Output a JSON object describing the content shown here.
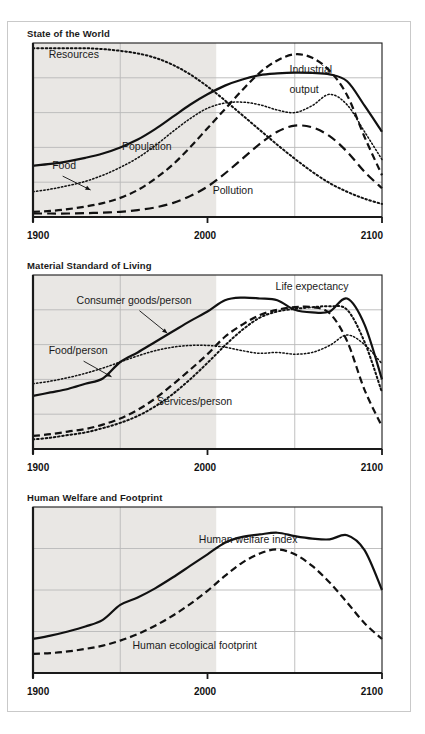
{
  "figure": {
    "panels": [
      {
        "title": "State of the World",
        "axis": {
          "start": "1900",
          "mid": "2000",
          "end": "2100"
        },
        "annotations": [
          {
            "name": "resources",
            "label": "Resources",
            "x": 0.045,
            "y": 0.085
          },
          {
            "name": "industrial-output-line1",
            "label": "Industrial",
            "x": 0.735,
            "y": 0.175
          },
          {
            "name": "industrial-output-line2",
            "label": "output",
            "x": 0.735,
            "y": 0.285
          },
          {
            "name": "population",
            "label": "Population",
            "x": 0.255,
            "y": 0.615
          },
          {
            "name": "food",
            "label": "Food",
            "x": 0.055,
            "y": 0.725
          },
          {
            "name": "pollution",
            "label": "Pollution",
            "x": 0.515,
            "y": 0.865
          }
        ]
      },
      {
        "title": "Material Standard of Living",
        "axis": {
          "start": "1900",
          "mid": "2000",
          "end": "2100"
        },
        "annotations": [
          {
            "name": "consumer-goods-per-person",
            "label": "Consumer goods/person",
            "x": 0.125,
            "y": 0.165
          },
          {
            "name": "life-expectancy",
            "label": "Life expectancy",
            "x": 0.695,
            "y": 0.085
          },
          {
            "name": "food-per-person",
            "label": "Food/person",
            "x": 0.045,
            "y": 0.455
          },
          {
            "name": "services-per-person",
            "label": "Services/person",
            "x": 0.355,
            "y": 0.745
          }
        ]
      },
      {
        "title": "Human Welfare and Footprint",
        "axis": {
          "start": "1900",
          "mid": "2000",
          "end": "2100"
        },
        "annotations": [
          {
            "name": "human-welfare-index",
            "label": "Human welfare index",
            "x": 0.475,
            "y": 0.215
          },
          {
            "name": "human-ecological-footprint",
            "label": "Human ecological footprint",
            "x": 0.285,
            "y": 0.855
          }
        ]
      }
    ]
  },
  "chart_data": [
    {
      "type": "line",
      "title": "State of the World",
      "xlabel": "",
      "ylabel": "",
      "xlim": [
        1900,
        2100
      ],
      "xticks": [
        1900,
        2000,
        2100
      ],
      "ytick_gridlines": 4,
      "grid": true,
      "shaded_history_end": 2005,
      "legend": "inline-annotations",
      "x": [
        1900,
        1910,
        1920,
        1930,
        1940,
        1950,
        1960,
        1970,
        1980,
        1990,
        2000,
        2010,
        2020,
        2030,
        2040,
        2050,
        2060,
        2070,
        2080,
        2090,
        2100
      ],
      "series": [
        {
          "name": "Resources",
          "style": "dotted",
          "values": [
            0.97,
            0.97,
            0.97,
            0.97,
            0.965,
            0.955,
            0.94,
            0.915,
            0.875,
            0.82,
            0.75,
            0.67,
            0.585,
            0.5,
            0.415,
            0.335,
            0.26,
            0.195,
            0.145,
            0.105,
            0.075
          ]
        },
        {
          "name": "Industrial output",
          "style": "dashed",
          "values": [
            0.03,
            0.035,
            0.045,
            0.06,
            0.08,
            0.11,
            0.155,
            0.22,
            0.3,
            0.4,
            0.51,
            0.62,
            0.73,
            0.83,
            0.9,
            0.935,
            0.915,
            0.84,
            0.7,
            0.46,
            0.24
          ]
        },
        {
          "name": "Population",
          "style": "solid",
          "values": [
            0.295,
            0.305,
            0.32,
            0.34,
            0.365,
            0.4,
            0.445,
            0.505,
            0.575,
            0.645,
            0.705,
            0.755,
            0.79,
            0.815,
            0.825,
            0.83,
            0.828,
            0.82,
            0.78,
            0.64,
            0.49
          ]
        },
        {
          "name": "Food",
          "style": "dotted-fine",
          "values": [
            0.145,
            0.16,
            0.18,
            0.205,
            0.24,
            0.285,
            0.34,
            0.41,
            0.49,
            0.565,
            0.625,
            0.655,
            0.66,
            0.645,
            0.615,
            0.6,
            0.64,
            0.705,
            0.645,
            0.49,
            0.33
          ]
        },
        {
          "name": "Pollution",
          "style": "dashed-long",
          "values": [
            0.02,
            0.02,
            0.02,
            0.022,
            0.025,
            0.03,
            0.04,
            0.055,
            0.08,
            0.12,
            0.175,
            0.25,
            0.335,
            0.42,
            0.49,
            0.525,
            0.515,
            0.465,
            0.375,
            0.26,
            0.165
          ]
        }
      ]
    },
    {
      "type": "line",
      "title": "Material Standard of Living",
      "xlabel": "",
      "ylabel": "",
      "xlim": [
        1900,
        2100
      ],
      "xticks": [
        1900,
        2000,
        2100
      ],
      "ytick_gridlines": 4,
      "grid": true,
      "shaded_history_end": 2005,
      "legend": "inline-annotations",
      "x": [
        1900,
        1910,
        1920,
        1930,
        1940,
        1950,
        1960,
        1970,
        1980,
        1990,
        2000,
        2010,
        2020,
        2030,
        2040,
        2050,
        2060,
        2070,
        2080,
        2090,
        2100
      ],
      "series": [
        {
          "name": "Life expectancy",
          "style": "solid",
          "values": [
            0.305,
            0.325,
            0.345,
            0.375,
            0.405,
            0.5,
            0.555,
            0.615,
            0.675,
            0.735,
            0.79,
            0.855,
            0.87,
            0.865,
            0.855,
            0.8,
            0.785,
            0.79,
            0.865,
            0.715,
            0.4
          ]
        },
        {
          "name": "Consumer goods/person",
          "style": "dashed",
          "values": [
            0.075,
            0.085,
            0.1,
            0.115,
            0.14,
            0.175,
            0.225,
            0.29,
            0.37,
            0.455,
            0.545,
            0.645,
            0.715,
            0.77,
            0.8,
            0.815,
            0.815,
            0.78,
            0.62,
            0.34,
            0.13
          ]
        },
        {
          "name": "Food/person",
          "style": "dotted",
          "values": [
            0.055,
            0.065,
            0.08,
            0.095,
            0.12,
            0.15,
            0.19,
            0.245,
            0.315,
            0.4,
            0.495,
            0.595,
            0.685,
            0.755,
            0.79,
            0.805,
            0.815,
            0.82,
            0.8,
            0.615,
            0.325
          ]
        },
        {
          "name": "Services/person",
          "style": "dotted-fine",
          "values": [
            0.375,
            0.39,
            0.41,
            0.435,
            0.465,
            0.5,
            0.535,
            0.565,
            0.585,
            0.595,
            0.595,
            0.585,
            0.565,
            0.55,
            0.555,
            0.545,
            0.555,
            0.595,
            0.655,
            0.6,
            0.49
          ]
        }
      ]
    },
    {
      "type": "line",
      "title": "Human Welfare and Footprint",
      "xlabel": "",
      "ylabel": "",
      "xlim": [
        1900,
        2100
      ],
      "xticks": [
        1900,
        2000,
        2100
      ],
      "ytick_gridlines": 3,
      "grid": true,
      "shaded_history_end": 2005,
      "legend": "inline-annotations",
      "x": [
        1900,
        1910,
        1920,
        1930,
        1940,
        1950,
        1960,
        1970,
        1980,
        1990,
        2000,
        2010,
        2020,
        2030,
        2040,
        2050,
        2060,
        2070,
        2080,
        2090,
        2100
      ],
      "series": [
        {
          "name": "Human welfare index",
          "style": "solid",
          "values": [
            0.205,
            0.225,
            0.25,
            0.28,
            0.32,
            0.41,
            0.455,
            0.51,
            0.575,
            0.645,
            0.715,
            0.785,
            0.82,
            0.835,
            0.845,
            0.825,
            0.81,
            0.805,
            0.83,
            0.74,
            0.5
          ]
        },
        {
          "name": "Human ecological footprint",
          "style": "dashed",
          "values": [
            0.115,
            0.12,
            0.13,
            0.145,
            0.165,
            0.195,
            0.235,
            0.285,
            0.345,
            0.415,
            0.495,
            0.585,
            0.665,
            0.72,
            0.745,
            0.715,
            0.645,
            0.545,
            0.425,
            0.3,
            0.205
          ]
        }
      ]
    }
  ],
  "colors": {
    "line": "#111111",
    "grid": "#b9b9b9",
    "frame": "#1a1a1a",
    "shade": "#e9e7e4",
    "outer_border": "#c9c9c9",
    "text": "#1a1a1a"
  }
}
